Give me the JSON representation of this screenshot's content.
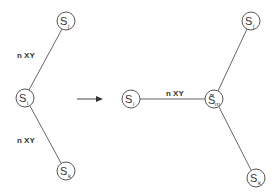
{
  "diagram": {
    "colors": {
      "stroke": "#555555",
      "text": "#333333",
      "background": "#ffffff"
    },
    "before": {
      "nodes": [
        {
          "id": "j",
          "base": "S",
          "sub": "j"
        },
        {
          "id": "i",
          "base": "S",
          "sub": "i"
        },
        {
          "id": "k",
          "base": "S",
          "sub": "k"
        }
      ],
      "edge_labels": [
        "n XY",
        "n XY"
      ]
    },
    "arrow": {
      "icon": "right-arrow-icon"
    },
    "after": {
      "nodes": [
        {
          "id": "i",
          "base": "S",
          "sub": "i"
        },
        {
          "id": "m",
          "base": "S̃",
          "sub": "m"
        },
        {
          "id": "j",
          "base": "S",
          "sub": "j"
        },
        {
          "id": "k",
          "base": "S",
          "sub": "k"
        }
      ],
      "edge_labels": [
        "n XY"
      ]
    }
  }
}
